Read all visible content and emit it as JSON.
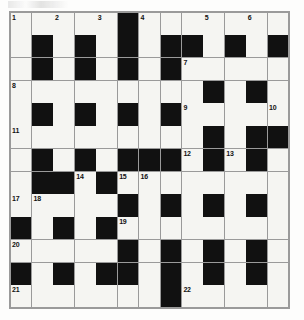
{
  "puzzle": {
    "name": "crossword-grid",
    "rows": 13,
    "cols": 13,
    "colors": {
      "block": "#111111",
      "open": "#f5f5f2",
      "gridline": "#9a9a9a",
      "number_text": "#111111",
      "page_background": "#ffffff"
    },
    "legend": {
      "block_symbol": "#",
      "open_symbol": "."
    },
    "grid": [
      ".....#.......",
      ".#.#.#.##.#.#",
      ".#.#.#.#.....",
      ".........#.#.",
      ".#.#.#.#.....",
      ".........#.##",
      ".#.#.###.#.#.",
      ".##.#........",
      ".....#.#.#.#.",
      "#.#.#........",
      ".....#.#.#.#.",
      "#.#.##.#.#.#.",
      ".......#.....",
      ""
    ],
    "grid_rows": [
      ".....#.......",
      ".#.#.#.##.#.#",
      ".#.#.#.#.....",
      ".........#.#.",
      ".#.#.#.#.....",
      ".........#.##",
      ".#.#.###.#.#.",
      ".##.#........",
      ".....#.#.#.#.",
      "#.#.#........",
      ".....#.#.#.#.",
      "#.#.##.#.#.#.",
      ".......#....."
    ],
    "numbers": [
      {
        "label": "1",
        "row": 0,
        "col": 0
      },
      {
        "label": "2",
        "row": 0,
        "col": 2
      },
      {
        "label": "3",
        "row": 0,
        "col": 4
      },
      {
        "label": "4",
        "row": 0,
        "col": 6
      },
      {
        "label": "5",
        "row": 0,
        "col": 9
      },
      {
        "label": "6",
        "row": 0,
        "col": 11
      },
      {
        "label": "7",
        "row": 2,
        "col": 8
      },
      {
        "label": "8",
        "row": 3,
        "col": 0
      },
      {
        "label": "9",
        "row": 4,
        "col": 8
      },
      {
        "label": "10",
        "row": 4,
        "col": 12
      },
      {
        "label": "11",
        "row": 5,
        "col": 0
      },
      {
        "label": "12",
        "row": 6,
        "col": 8
      },
      {
        "label": "13",
        "row": 6,
        "col": 10
      },
      {
        "label": "14",
        "row": 7,
        "col": 3
      },
      {
        "label": "15",
        "row": 7,
        "col": 5
      },
      {
        "label": "16",
        "row": 7,
        "col": 6
      },
      {
        "label": "17",
        "row": 8,
        "col": 0
      },
      {
        "label": "18",
        "row": 8,
        "col": 1
      },
      {
        "label": "19",
        "row": 9,
        "col": 5
      },
      {
        "label": "20",
        "row": 10,
        "col": 0
      },
      {
        "label": "21",
        "row": 12,
        "col": 0
      },
      {
        "label": "22",
        "row": 12,
        "col": 8
      }
    ]
  }
}
